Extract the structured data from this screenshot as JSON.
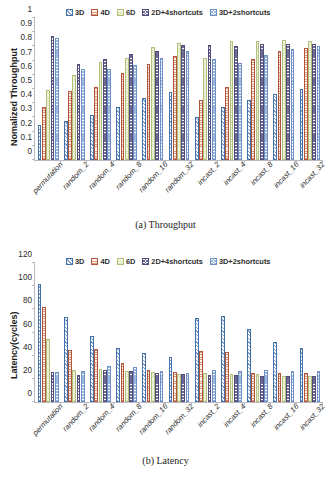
{
  "figure": {
    "series_names": [
      "3D",
      "4D",
      "6D",
      "2D+4shortcuts",
      "3D+2shortcuts"
    ],
    "categories": [
      "permutation",
      "random_2",
      "random_4",
      "random_8",
      "random_16",
      "random_32",
      "incast_2",
      "incast_4",
      "incast_8",
      "incast_16",
      "incast_32"
    ],
    "colors": {
      "series_3d": "#4472a8",
      "series_4d": "#b2553c",
      "series_6d": "#b3bf7d",
      "series_2d4s": "#514d7a",
      "series_3d2s": "#6f90c4",
      "axis": "#b9b9c4",
      "text": "#2b2b2b"
    },
    "panel_a_caption": "(a) Throughput",
    "panel_b_caption": "(b) Latency"
  },
  "chart_data": [
    {
      "type": "bar",
      "title": "(a) Throughput",
      "xlabel": "",
      "ylabel": "Nomalized Throughput",
      "ylim": [
        0,
        1
      ],
      "yticks": [
        "0",
        "0.1",
        "0.2",
        "0.3",
        "0.4",
        "0.5",
        "0.6",
        "0.7",
        "0.8",
        "0.9",
        "1"
      ],
      "grid": false,
      "legend_position": "top",
      "categories": [
        "permutation",
        "random_2",
        "random_4",
        "random_8",
        "random_16",
        "random_32",
        "incast_2",
        "incast_4",
        "incast_8",
        "incast_16",
        "incast_32"
      ],
      "series": [
        {
          "name": "3D",
          "values": [
            0.25,
            0.275,
            0.32,
            0.375,
            0.435,
            0.48,
            0.305,
            0.37,
            0.425,
            0.465,
            0.5
          ]
        },
        {
          "name": "4D",
          "values": [
            0.375,
            0.485,
            0.515,
            0.615,
            0.675,
            0.73,
            0.425,
            0.515,
            0.71,
            0.77,
            0.79
          ]
        },
        {
          "name": "6D",
          "values": [
            0.49,
            0.6,
            0.69,
            0.715,
            0.795,
            0.825,
            0.72,
            0.84,
            0.84,
            0.845,
            0.84
          ]
        },
        {
          "name": "2D+4shortcuts",
          "values": [
            0.87,
            0.675,
            0.71,
            0.745,
            0.765,
            0.81,
            0.81,
            0.805,
            0.815,
            0.82,
            0.815
          ]
        },
        {
          "name": "3D+2shortcuts",
          "values": [
            0.86,
            0.64,
            0.64,
            0.67,
            0.715,
            0.77,
            0.71,
            0.68,
            0.74,
            0.78,
            0.8
          ]
        }
      ]
    },
    {
      "type": "bar",
      "title": "(b) Latency",
      "xlabel": "",
      "ylabel": "Latency(cycles)",
      "ylim": [
        0,
        120
      ],
      "yticks": [
        "0",
        "20",
        "40",
        "60",
        "80",
        "100",
        "120"
      ],
      "grid": false,
      "legend_position": "top",
      "categories": [
        "permutation",
        "random_2",
        "random_4",
        "random_8",
        "random_16",
        "random_32",
        "incast_2",
        "incast_4",
        "incast_8",
        "incast_16",
        "incast_32"
      ],
      "series": [
        {
          "name": "3D",
          "values": [
            102,
            73,
            57,
            47,
            42.5,
            39,
            72.5,
            74.5,
            63,
            51.5,
            47
          ]
        },
        {
          "name": "4D",
          "values": [
            82,
            45,
            45.5,
            33.5,
            27.5,
            25.5,
            44,
            43,
            25,
            25,
            25
          ]
        },
        {
          "name": "6D",
          "values": [
            54.5,
            28,
            28.5,
            27,
            25.5,
            24.5,
            25,
            24.5,
            24.5,
            22.5,
            22.5
          ]
        },
        {
          "name": "2D+4shortcuts",
          "values": [
            25.5,
            23,
            28,
            26.5,
            25,
            24.5,
            23.5,
            23,
            22.5,
            22.5,
            22.5
          ]
        },
        {
          "name": "3D+2shortcuts",
          "values": [
            26,
            27,
            31,
            30.5,
            27,
            25,
            28,
            27,
            27.5,
            26.5,
            26.5
          ]
        }
      ]
    }
  ]
}
